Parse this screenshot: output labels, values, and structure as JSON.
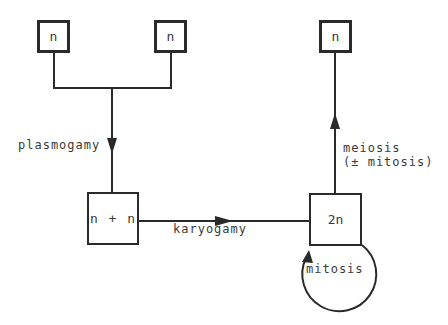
{
  "diagram": {
    "type": "life-cycle flow diagram",
    "nodes": {
      "haploid_left": {
        "label": "n"
      },
      "haploid_right": {
        "label": "n"
      },
      "dikaryon": {
        "label_left": "n",
        "label_mid": "+",
        "label_right": "n"
      },
      "diploid": {
        "label": "2n"
      },
      "haploid_product": {
        "label": "n"
      }
    },
    "edges": {
      "plasmogamy": {
        "label": "plasmogamy",
        "from": "haploid_left + haploid_right",
        "to": "dikaryon"
      },
      "karyogamy": {
        "label": "karyogamy",
        "from": "dikaryon",
        "to": "diploid"
      },
      "meiosis": {
        "label_line1": "meiosis",
        "label_line2": "(± mitosis)",
        "from": "diploid",
        "to": "haploid_product"
      },
      "mitosis_loop": {
        "label": "mitosis",
        "from": "diploid",
        "to": "diploid"
      }
    },
    "colors": {
      "stroke": "#2a2a2a",
      "text": "#3a3a3a",
      "background": "#ffffff"
    }
  }
}
